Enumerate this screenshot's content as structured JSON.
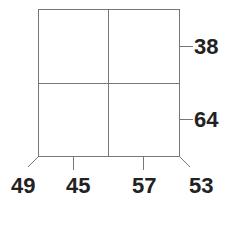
{
  "diagram": {
    "type": "2x2 grid with edge labels",
    "right_labels": [
      {
        "label": "38",
        "row": "top"
      },
      {
        "label": "64",
        "row": "bottom"
      }
    ],
    "bottom_labels": [
      {
        "label": "49",
        "position": "bottom-left diagonal"
      },
      {
        "label": "45",
        "position": "left column"
      },
      {
        "label": "57",
        "position": "right column"
      },
      {
        "label": "53",
        "position": "bottom-right diagonal"
      }
    ],
    "line_color": "#777777",
    "text_color": "#222222"
  }
}
